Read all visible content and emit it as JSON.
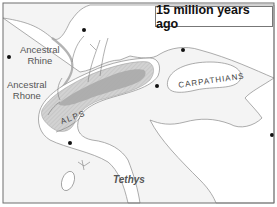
{
  "map": {
    "title": "15 million years ago",
    "labels": {
      "ancestral_rhine": [
        "Ancestral",
        "Rhine"
      ],
      "ancestral_rhone": [
        "Ancestral",
        "Rhone"
      ],
      "alps": "ALPS",
      "carpathians": "CARPATHIANS",
      "tethys": "Tethys"
    },
    "colors": {
      "land": "#ffffff",
      "sea": "#f3f3f3",
      "mountain_dark": "#a9a9a9",
      "mountain_light": "#cfcfcf",
      "coastline": "#8a8a8a",
      "frame": "#6e6e6e"
    },
    "city_dots": 6
  }
}
